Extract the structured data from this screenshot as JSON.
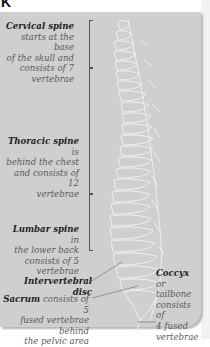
{
  "header": {
    "glyph": "K"
  },
  "diagram": {
    "labels": [
      {
        "id": "cervical",
        "term": "Cervical spine",
        "desc": " starts at the base of the skull and consists of 7 vertebrae",
        "lines": [
          "starts at the base",
          "of the skull and",
          "consists of 7",
          "vertebrae"
        ]
      },
      {
        "id": "thoracic",
        "term": "Thoracic spine",
        "desc_inline": " is",
        "lines": [
          "behind the chest",
          "and consists of 12",
          "vertebrae"
        ]
      },
      {
        "id": "lumbar",
        "term": "Lumbar spine",
        "desc_inline": " in",
        "lines": [
          "the lower back",
          "consists of 5",
          "vertebrae"
        ]
      },
      {
        "id": "intervertebral",
        "term": "Intervertebral disc"
      },
      {
        "id": "sacrum",
        "term": "Sacrum",
        "desc_inline": " consists of 5",
        "lines": [
          "fused vertebrae behind",
          "the pelvic area"
        ]
      },
      {
        "id": "coccyx",
        "term": "Coccyx",
        "desc_inline": " or",
        "lines": [
          "tailbone",
          "consists of",
          "4 fused",
          "vertebrae"
        ]
      }
    ]
  },
  "colors": {
    "panel": "#cfcfcf",
    "term": "#222222",
    "desc": "#5a5a5a",
    "bone": "#f4f4f4"
  }
}
